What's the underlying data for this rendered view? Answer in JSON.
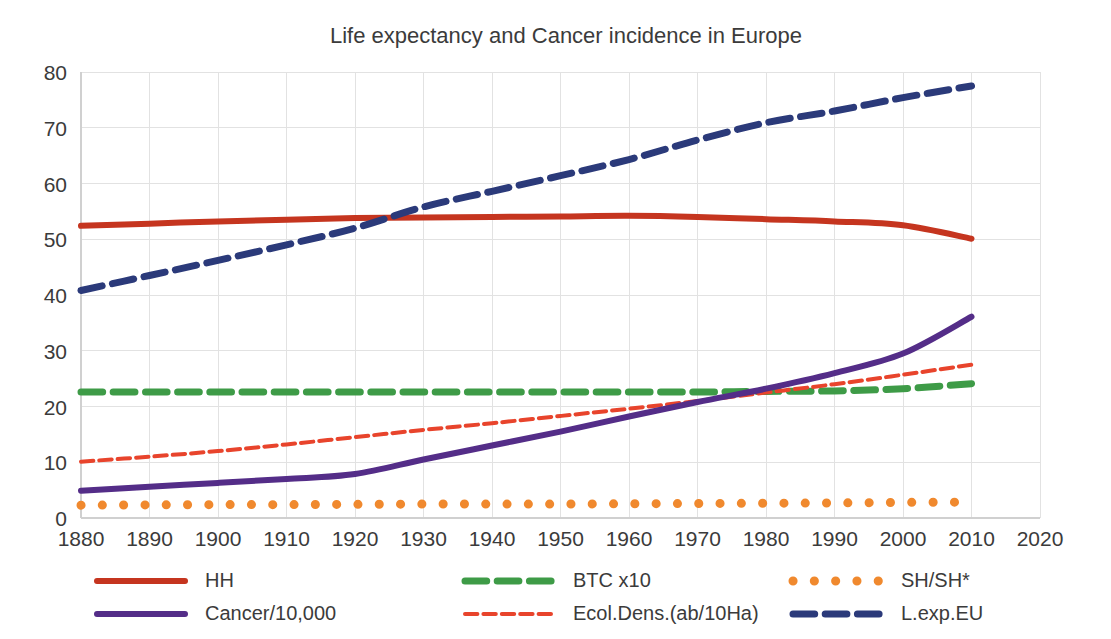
{
  "chart_data": {
    "type": "line",
    "title": "Life expectancy and Cancer incidence in Europe",
    "xlabel": "",
    "ylabel": "",
    "xlim": [
      1880,
      2020
    ],
    "ylim": [
      0,
      80
    ],
    "grid": true,
    "legend_position": "bottom",
    "x_ticks": [
      1880,
      1890,
      1900,
      1910,
      1920,
      1930,
      1940,
      1950,
      1960,
      1970,
      1980,
      1990,
      2000,
      2010,
      2020
    ],
    "y_ticks": [
      0,
      10,
      20,
      30,
      40,
      50,
      60,
      70,
      80
    ],
    "x": [
      1880,
      1890,
      1900,
      1910,
      1920,
      1930,
      1940,
      1950,
      1960,
      1970,
      1980,
      1990,
      2000,
      2010
    ],
    "series": [
      {
        "name": "HH",
        "color": "#C5351F",
        "style": "solid",
        "width": 6,
        "values": [
          52.4,
          52.8,
          53.2,
          53.5,
          53.8,
          53.9,
          54.0,
          54.1,
          54.2,
          54.0,
          53.6,
          53.2,
          52.5,
          50.1
        ]
      },
      {
        "name": "Cancer/10,000",
        "color": "#542D88",
        "style": "solid",
        "width": 6,
        "values": [
          4.9,
          5.6,
          6.3,
          7.0,
          7.9,
          10.5,
          13.0,
          15.5,
          18.2,
          20.8,
          23.2,
          26.0,
          29.5,
          36.1
        ]
      },
      {
        "name": "BTC x10",
        "color": "#3E9B47",
        "style": "dashed",
        "width": 7,
        "values": [
          22.6,
          22.6,
          22.6,
          22.6,
          22.6,
          22.6,
          22.6,
          22.6,
          22.6,
          22.6,
          22.7,
          22.8,
          23.2,
          24.1
        ]
      },
      {
        "name": "Ecol.Dens.(ab/10Ha)",
        "color": "#E8442C",
        "style": "dashed",
        "width": 4,
        "values": [
          10.1,
          11.0,
          12.0,
          13.2,
          14.5,
          15.8,
          17.0,
          18.3,
          19.6,
          21.0,
          22.5,
          24.0,
          25.7,
          27.5
        ]
      },
      {
        "name": "SH/SH*",
        "color": "#F0892E",
        "style": "dotted",
        "width": 9,
        "values": [
          2.3,
          2.35,
          2.4,
          2.4,
          2.45,
          2.5,
          2.5,
          2.5,
          2.55,
          2.6,
          2.65,
          2.7,
          2.8,
          2.85
        ]
      },
      {
        "name": "L.exp.EU",
        "color": "#2B3A7A",
        "style": "dashed",
        "width": 7,
        "values": [
          40.8,
          43.5,
          46.2,
          49.0,
          52.0,
          55.8,
          58.6,
          61.4,
          64.3,
          67.8,
          70.9,
          73.0,
          75.4,
          77.5
        ]
      }
    ],
    "legend": [
      {
        "label": "HH",
        "color": "#C5351F",
        "style": "solid",
        "column": 0,
        "row": 0
      },
      {
        "label": "Cancer/10,000",
        "color": "#542D88",
        "style": "solid",
        "column": 0,
        "row": 1
      },
      {
        "label": "BTC x10",
        "color": "#3E9B47",
        "style": "dashed",
        "column": 1,
        "row": 0
      },
      {
        "label": "Ecol.Dens.(ab/10Ha)",
        "color": "#E8442C",
        "style": "dashed",
        "column": 1,
        "row": 1
      },
      {
        "label": "SH/SH*",
        "color": "#F0892E",
        "style": "dotted",
        "column": 2,
        "row": 0
      },
      {
        "label": "L.exp.EU",
        "color": "#2B3A7A",
        "style": "dashed",
        "column": 2,
        "row": 1
      }
    ]
  },
  "colors": {
    "background": "#FFFFFF",
    "grid": "#E2E2E2",
    "axis": "#D0D0D0",
    "text": "#3B3B3B"
  }
}
